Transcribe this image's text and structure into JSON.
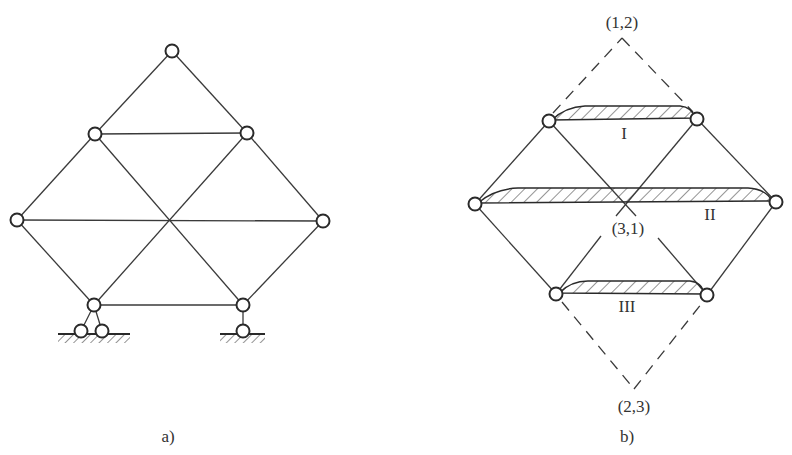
{
  "figure": {
    "panels": [
      {
        "id": "a",
        "caption": "a)",
        "description": "Pin-jointed truss on supports",
        "nodes": [
          {
            "id": "top",
            "x": 172,
            "y": 51
          },
          {
            "id": "upper-left",
            "x": 95,
            "y": 134
          },
          {
            "id": "upper-right",
            "x": 247,
            "y": 133
          },
          {
            "id": "left",
            "x": 17,
            "y": 220
          },
          {
            "id": "right",
            "x": 323,
            "y": 221
          },
          {
            "id": "bottom-left",
            "x": 94,
            "y": 305
          },
          {
            "id": "bottom-right",
            "x": 243,
            "y": 305
          }
        ],
        "supports": [
          {
            "id": "left-support",
            "type": "two-bar",
            "hinges": [
              [
                81,
                331
              ],
              [
                102,
                331
              ]
            ]
          },
          {
            "id": "right-support",
            "type": "single-bar",
            "hinges": [
              [
                243,
                331
              ]
            ]
          }
        ]
      },
      {
        "id": "b",
        "caption": "b)",
        "description": "Kinematic analysis: rigid bodies and instantaneous centers",
        "bodies": [
          {
            "id": "I",
            "label": "I"
          },
          {
            "id": "II",
            "label": "II"
          },
          {
            "id": "III",
            "label": "III"
          }
        ],
        "instant_centers": [
          {
            "id": "12",
            "label": "(1,2)"
          },
          {
            "id": "31",
            "label": "(3,1)"
          },
          {
            "id": "23",
            "label": "(2,3)"
          }
        ]
      }
    ],
    "labels": {
      "caption_a": "a)",
      "caption_b": "b)",
      "body_I": "I",
      "body_II": "II",
      "body_III": "III",
      "center_12": "(1,2)",
      "center_31": "(3,1)",
      "center_23": "(2,3)"
    },
    "colors": {
      "line": "#3a3a3a",
      "node_stroke": "#2a2a2a",
      "background": "#ffffff"
    }
  }
}
